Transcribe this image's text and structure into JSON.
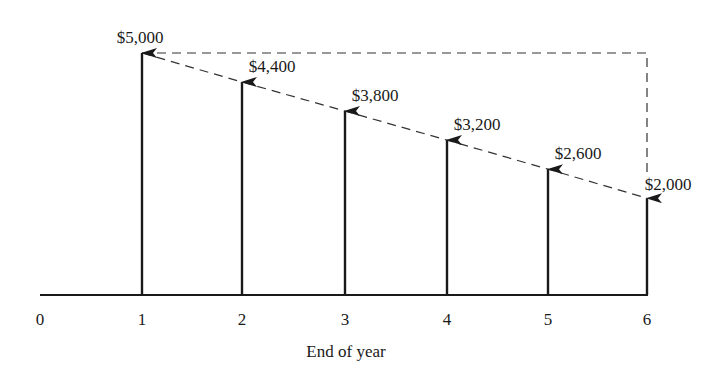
{
  "chart_data": {
    "type": "bar",
    "subtype": "cash-flow-arrow-diagram",
    "title": "",
    "xlabel": "End of year",
    "ylabel": "",
    "x_ticks": [
      "0",
      "1",
      "2",
      "3",
      "4",
      "5",
      "6"
    ],
    "categories": [
      "1",
      "2",
      "3",
      "4",
      "5",
      "6"
    ],
    "values": [
      5000,
      4400,
      3800,
      3200,
      2600,
      2000
    ],
    "value_labels": [
      "$5,000",
      "$4,400",
      "$3,800",
      "$3,200",
      "$2,600",
      "$2,000"
    ],
    "annotations": [
      "Dashed line connecting arrow tops (linear decrease of $600 per year)",
      "Dashed horizontal line at $5,000 level from year 1 to year 6, with dashed vertical drop at year 6 to $2,000"
    ],
    "ylim": [
      0,
      5000
    ],
    "grid": false,
    "legend": null
  },
  "axis": {
    "xlabel": "End of year",
    "ticks": [
      "0",
      "1",
      "2",
      "3",
      "4",
      "5",
      "6"
    ]
  },
  "arrows": [
    {
      "year": "1",
      "label": "$5,000"
    },
    {
      "year": "2",
      "label": "$4,400"
    },
    {
      "year": "3",
      "label": "$3,800"
    },
    {
      "year": "4",
      "label": "$3,200"
    },
    {
      "year": "5",
      "label": "$2,600"
    },
    {
      "year": "6",
      "label": "$2,000"
    }
  ]
}
